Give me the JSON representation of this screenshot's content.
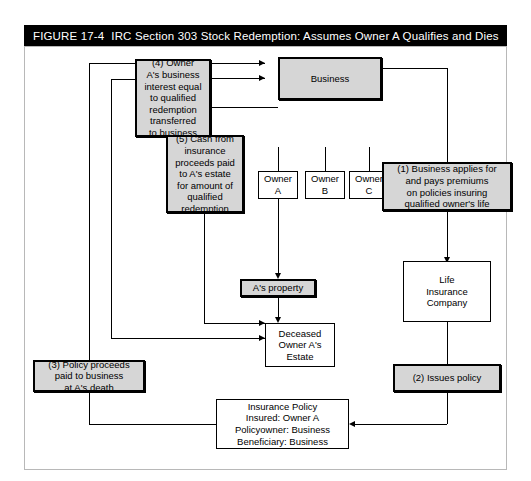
{
  "figure": {
    "number": "FIGURE 17-4",
    "title": "IRC Section 303 Stock Redemption: Assumes Owner A Qualifies and Dies"
  },
  "nodes": {
    "business": "Business",
    "owner_a": "Owner\nA",
    "owner_b": "Owner\nB",
    "owner_c": "Owner\nC",
    "step4": "(4) Owner\nA's  business\ninterest equal\nto qualified\nredemption\ntransferred\nto business",
    "step5": "(5) Cash from\ninsurance\nproceeds paid\nto A's estate\nfor amount of\nqualified\nredemption",
    "step1": "(1) Business applies for\nand pays premiums\non policies insuring\nqualified owner's life",
    "step2": "(2) Issues policy",
    "step3": "(3) Policy proceeds\npaid to business\nat A's death",
    "a_property": "A's property",
    "deceased_estate": "Deceased\nOwner A's\nEstate",
    "life_insurance_company": "Life\nInsurance\nCompany",
    "insurance_policy": "Insurance Policy\nInsured: Owner A\nPolicyowner: Business\nBeneficiary: Business"
  },
  "colors": {
    "title_bar_bg": "#000000",
    "title_bar_text": "#ffffff",
    "shaded_box_fill": "#d6d6d6",
    "plain_box_fill": "#ffffff",
    "line": "#000000",
    "frame_border": "#b8b8b8"
  }
}
